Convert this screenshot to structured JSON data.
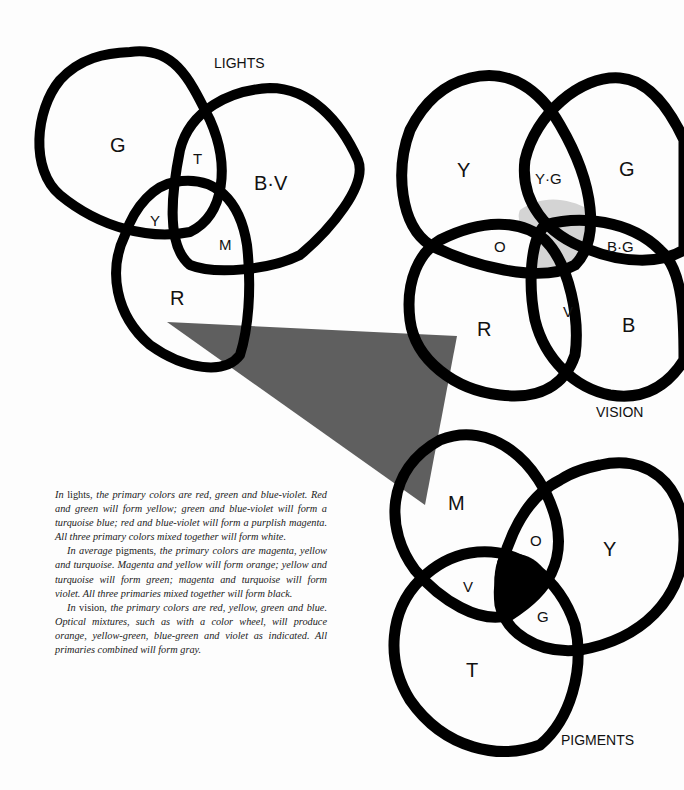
{
  "diagrams": {
    "lights": {
      "title": "LIGHTS",
      "regions": {
        "green": "G",
        "blue_violet": "B·V",
        "red": "R",
        "turquoise": "T",
        "yellow": "Y",
        "magenta": "M"
      }
    },
    "vision": {
      "title": "VISION",
      "regions": {
        "yellow": "Y",
        "green": "G",
        "red": "R",
        "blue": "B",
        "yellow_green": "Y·G",
        "orange": "O",
        "blue_green": "B·G",
        "violet": "V"
      },
      "center_fill": "#d4d4d4"
    },
    "pigments": {
      "title": "PIGMENTS",
      "regions": {
        "magenta": "M",
        "yellow": "Y",
        "turquoise": "T",
        "orange": "O",
        "violet": "V",
        "green": "G"
      },
      "center_fill": "#000000"
    }
  },
  "triangle": {
    "color": "#5f5f5f"
  },
  "caption": {
    "p1_lead": "In",
    "p1_word": " lights, ",
    "p1_rest": "the primary colors are red, green and blue-violet. Red and green will form yellow; green and blue-violet will form a turquoise blue; red and blue-violet will form a purplish magenta. All three primary colors mixed together will form white.",
    "p2_lead": "In average",
    "p2_word": " pigments, ",
    "p2_rest": "the primary colors are magenta, yellow and turquoise. Magenta and yellow will form orange; yellow and turquoise will form green; magenta and turquoise will form violet. All three primaries mixed together will form black.",
    "p3_lead": "In",
    "p3_word": " vision, ",
    "p3_rest": "the primary colors are red, yellow, green and blue. Optical mixtures, such as with a color wheel, will produce orange, yellow-green, blue-green and violet as indicated. All primaries combined will form gray."
  }
}
